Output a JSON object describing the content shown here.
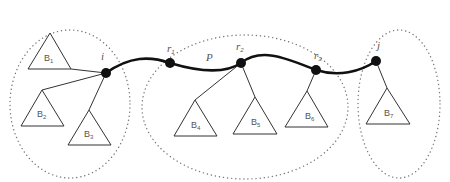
{
  "diagram": {
    "path_label": "P",
    "nodes": {
      "i": {
        "label": "i",
        "x": 106,
        "y": 73
      },
      "r1": {
        "label": "r",
        "sub": "1",
        "x": 170,
        "y": 63
      },
      "r2": {
        "label": "r",
        "sub": "2",
        "x": 241,
        "y": 63
      },
      "r3": {
        "label": "r",
        "sub": "3",
        "x": 316,
        "y": 70
      },
      "j": {
        "label": "j",
        "x": 376,
        "y": 61
      }
    },
    "subtrees": [
      {
        "label": "B",
        "sub": "1"
      },
      {
        "label": "B",
        "sub": "2"
      },
      {
        "label": "B",
        "sub": "3"
      },
      {
        "label": "B",
        "sub": "4"
      },
      {
        "label": "B",
        "sub": "5"
      },
      {
        "label": "B",
        "sub": "6"
      },
      {
        "label": "B",
        "sub": "7"
      }
    ],
    "groups": [
      "left-cluster",
      "path-cluster",
      "right-cluster"
    ]
  }
}
